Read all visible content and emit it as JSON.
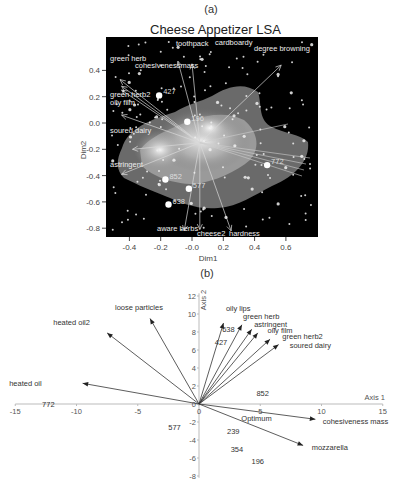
{
  "figure": {
    "panel_a_label": "(a)",
    "panel_b_label": "(b)"
  },
  "chart_data": [
    {
      "type": "scatter",
      "panel": "(a)",
      "title": "Cheese Appetizer LSA",
      "xlabel": "Dim1",
      "ylabel": "Dim2",
      "xlim": [
        -0.55,
        0.8
      ],
      "ylim": [
        -0.9,
        0.55
      ],
      "xticks": [
        "-0.4",
        "-0.2",
        "-0.0",
        "0.2",
        "0.4",
        "0.6"
      ],
      "xtick_values": [
        -0.4,
        -0.2,
        0.0,
        0.2,
        0.4,
        0.6
      ],
      "yticks": [
        "0.4",
        "0.2",
        "0.0",
        "-0.2",
        "-0.4",
        "-0.6",
        "-0.8"
      ],
      "ytick_values": [
        0.4,
        0.2,
        0.0,
        -0.2,
        -0.4,
        -0.6,
        -0.8
      ],
      "background": "#000000",
      "grid": false,
      "vector_origin": [
        0.05,
        -0.15
      ],
      "attribute_vectors": [
        {
          "label": "green herb",
          "x": -0.46,
          "y": 0.33
        },
        {
          "label": "cohesivenessmass",
          "x": -0.45,
          "y": 0.28
        },
        {
          "label": "green herb2",
          "x": -0.45,
          "y": 0.25
        },
        {
          "label": "oily film",
          "x": -0.45,
          "y": 0.06
        },
        {
          "label": "toothpack",
          "x": -0.09,
          "y": 0.47
        },
        {
          "label": "cardboardy",
          "x": -0.0,
          "y": 0.45
        },
        {
          "label": "degree browning",
          "x": 0.57,
          "y": 0.44
        },
        {
          "label": "soured dairy",
          "x": -0.38,
          "y": -0.2
        },
        {
          "label": "astringent",
          "x": -0.45,
          "y": -0.39
        },
        {
          "label": "aware herbs",
          "x": -0.05,
          "y": -0.82
        },
        {
          "label": "cheese2",
          "x": 0.05,
          "y": -0.81
        },
        {
          "label": "hardness",
          "x": 0.25,
          "y": -0.82
        }
      ],
      "sample_points": [
        {
          "label": "427",
          "x": -0.21,
          "y": 0.21
        },
        {
          "label": "196",
          "x": -0.03,
          "y": 0.01
        },
        {
          "label": "772",
          "x": 0.48,
          "y": -0.32
        },
        {
          "label": "852",
          "x": -0.17,
          "y": -0.43
        },
        {
          "label": "577",
          "x": -0.02,
          "y": -0.5
        },
        {
          "label": "638",
          "x": -0.15,
          "y": -0.62
        }
      ]
    },
    {
      "type": "scatter",
      "panel": "(b)",
      "title": "",
      "xlabel": "Axis 1",
      "ylabel": "Axis 2",
      "xlim": [
        -15,
        15
      ],
      "ylim": [
        -8,
        12
      ],
      "xticks": [
        "-15",
        "-10",
        "-5",
        "0",
        "5",
        "10",
        "15"
      ],
      "xtick_values": [
        -15,
        -10,
        -5,
        0,
        5,
        10,
        15
      ],
      "yticks": [
        "12",
        "10",
        "8",
        "6",
        "4",
        "2",
        "0",
        "-2",
        "-4",
        "-6",
        "-8"
      ],
      "ytick_values": [
        12,
        10,
        8,
        6,
        4,
        2,
        0,
        -2,
        -4,
        -6,
        -8
      ],
      "grid": false,
      "attribute_vectors": [
        {
          "label": "loose particles",
          "x": -4.0,
          "y": 9.5
        },
        {
          "label": "heated oil2",
          "x": -7.5,
          "y": 7.9
        },
        {
          "label": "heated oil",
          "x": -9.5,
          "y": 2.3
        },
        {
          "label": "oily lips",
          "x": 2.0,
          "y": 9.0
        },
        {
          "label": "green herb",
          "x": 3.5,
          "y": 8.8
        },
        {
          "label": "astringent",
          "x": 4.3,
          "y": 8.3
        },
        {
          "label": "oily film",
          "x": 4.8,
          "y": 7.9
        },
        {
          "label": "green herb2",
          "x": 5.8,
          "y": 7.2
        },
        {
          "label": "soured dairy",
          "x": 6.5,
          "y": 6.6
        },
        {
          "label": "cohesiveness mass",
          "x": 9.5,
          "y": -1.7
        },
        {
          "label": "mozzarella",
          "x": 8.5,
          "y": -4.6
        }
      ],
      "sample_points": [
        {
          "label": "638",
          "x": 2.4,
          "y": 8.3
        },
        {
          "label": "427",
          "x": 1.8,
          "y": 6.9
        },
        {
          "label": "852",
          "x": 5.2,
          "y": 1.2
        },
        {
          "label": "772",
          "x": -12.3,
          "y": 0.0
        },
        {
          "label": "577",
          "x": -2.0,
          "y": -2.6
        },
        {
          "label": "239",
          "x": 2.8,
          "y": -3.0
        },
        {
          "label": "354",
          "x": 3.1,
          "y": -5.0
        },
        {
          "label": "196",
          "x": 4.8,
          "y": -6.3
        }
      ],
      "annotations": [
        {
          "label": "Optimum",
          "x": 4.7,
          "y": -1.6
        }
      ]
    }
  ]
}
